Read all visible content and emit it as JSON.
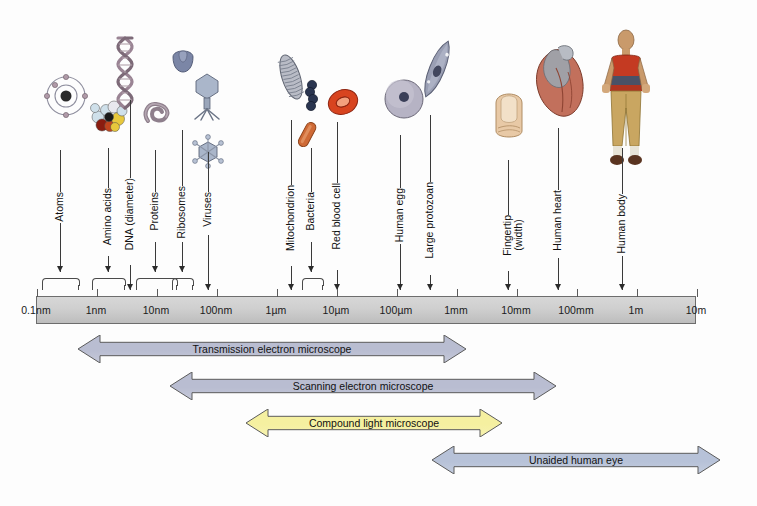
{
  "figure": {
    "colors": {
      "bar_fill": "#cfcfcf",
      "bar_stroke": "#6d6d6d",
      "arrow_grey": "#b9bdd1",
      "arrow_blue": "#b7c2d8",
      "arrow_yellow": "#f5f0a0",
      "arrow_stroke": "#5b5b5b",
      "text": "#111111"
    }
  },
  "scale": {
    "ticks": [
      {
        "label": "0.1nm",
        "x": 36
      },
      {
        "label": "1nm",
        "x": 96
      },
      {
        "label": "10nm",
        "x": 156
      },
      {
        "label": "100nm",
        "x": 216
      },
      {
        "label": "1µm",
        "x": 276
      },
      {
        "label": "10µm",
        "x": 336
      },
      {
        "label": "100µm",
        "x": 396
      },
      {
        "label": "1mm",
        "x": 456
      },
      {
        "label": "10mm",
        "x": 516
      },
      {
        "label": "100mm",
        "x": 576
      },
      {
        "label": "1m",
        "x": 636
      },
      {
        "label": "10m",
        "x": 696
      }
    ]
  },
  "specimens": [
    {
      "name": "Atoms",
      "label": "Atoms",
      "label_x": 60,
      "label_y": 192,
      "leader_x": 60,
      "leader_top": 150,
      "leader_bottom": 272,
      "marker": "brace",
      "brace_left": 42,
      "brace_right": 78
    },
    {
      "name": "Amino acids",
      "label": "Amino acids",
      "label_x": 108,
      "label_y": 188,
      "leader_x": 108,
      "leader_top": 148,
      "leader_bottom": 272,
      "marker": "brace",
      "brace_left": 92,
      "brace_right": 124
    },
    {
      "name": "DNA (diameter)",
      "label": "DNA (diameter)",
      "label_x": 130,
      "label_y": 178,
      "leader_x": 130,
      "leader_top": 100,
      "leader_bottom": 290,
      "marker": "arrow"
    },
    {
      "name": "Proteins",
      "label": "Proteins",
      "label_x": 155,
      "label_y": 192,
      "leader_x": 155,
      "leader_top": 150,
      "leader_bottom": 272,
      "marker": "brace",
      "brace_left": 136,
      "brace_right": 176
    },
    {
      "name": "Ribosomes",
      "label": "Ribosomes",
      "label_x": 182,
      "label_y": 186,
      "leader_x": 182,
      "leader_top": 130,
      "leader_bottom": 272,
      "marker": "brace",
      "brace_left": 172,
      "brace_right": 192
    },
    {
      "name": "Viruses",
      "label": "Viruses",
      "label_x": 208,
      "label_y": 192,
      "leader_x": 208,
      "leader_top": 152,
      "leader_bottom": 290,
      "marker": "arrow"
    },
    {
      "name": "Mitochondrion",
      "label": "Mitochondrion",
      "label_x": 291,
      "label_y": 185,
      "leader_x": 291,
      "leader_top": 120,
      "leader_bottom": 290,
      "marker": "arrow"
    },
    {
      "name": "Bacteria",
      "label": "Bacteria",
      "label_x": 311,
      "label_y": 192,
      "leader_x": 311,
      "leader_top": 148,
      "leader_bottom": 272,
      "marker": "brace",
      "brace_left": 302,
      "brace_right": 322
    },
    {
      "name": "Red blood cell",
      "label": "Red blood cell",
      "label_x": 337,
      "label_y": 183,
      "leader_x": 337,
      "leader_top": 122,
      "leader_bottom": 290,
      "marker": "arrow"
    },
    {
      "name": "Human egg",
      "label": "Human egg",
      "label_x": 400,
      "label_y": 188,
      "leader_x": 400,
      "leader_top": 135,
      "leader_bottom": 290,
      "marker": "arrow"
    },
    {
      "name": "Large protozoan",
      "label": "Large protozoan",
      "label_x": 430,
      "label_y": 182,
      "leader_x": 430,
      "leader_top": 115,
      "leader_bottom": 290,
      "marker": "arrow"
    },
    {
      "name": "Fingertip",
      "label": "Fingertip\n(width)",
      "label_x": 508,
      "label_y": 215,
      "leader_x": 508,
      "leader_top": 160,
      "leader_bottom": 290,
      "marker": "arrow"
    },
    {
      "name": "Human heart",
      "label": "Human heart",
      "label_x": 558,
      "label_y": 190,
      "leader_x": 558,
      "leader_top": 128,
      "leader_bottom": 290,
      "marker": "arrow"
    },
    {
      "name": "Human body",
      "label": "Human body",
      "label_x": 622,
      "label_y": 194,
      "leader_x": 622,
      "leader_top": 148,
      "leader_bottom": 290,
      "marker": "arrow"
    }
  ],
  "ranges": [
    {
      "label": "Transmission electron microscope",
      "left": 78,
      "right": 466,
      "top": 335,
      "height": 28,
      "color": "#b9bdd1"
    },
    {
      "label": "Scanning electron microscope",
      "left": 170,
      "right": 556,
      "top": 372,
      "height": 28,
      "color": "#b9bdd1"
    },
    {
      "label": "Compound light microscope",
      "left": 246,
      "right": 502,
      "top": 409,
      "height": 28,
      "color": "#f5f0a0"
    },
    {
      "label": "Unaided human eye",
      "left": 432,
      "right": 720,
      "top": 446,
      "height": 28,
      "color": "#b7c2d8"
    }
  ],
  "illustrations": [
    {
      "name": "atom-illustration",
      "x": 45,
      "y": 75,
      "kind": "atom"
    },
    {
      "name": "amino-acid-illustration",
      "x": 88,
      "y": 95,
      "kind": "molecule"
    },
    {
      "name": "dna-helix-illustration",
      "x": 112,
      "y": 36,
      "kind": "dna"
    },
    {
      "name": "protein-illustration",
      "x": 140,
      "y": 95,
      "kind": "protein"
    },
    {
      "name": "ribosome-illustration",
      "x": 168,
      "y": 45,
      "kind": "ribosome"
    },
    {
      "name": "bacteriophage-illustration",
      "x": 190,
      "y": 72,
      "kind": "phage"
    },
    {
      "name": "virus-illustration",
      "x": 192,
      "y": 135,
      "kind": "virus"
    },
    {
      "name": "mitochondrion-illustration",
      "x": 278,
      "y": 52,
      "kind": "mitochondrion"
    },
    {
      "name": "bacteria-cocci-illustration",
      "x": 303,
      "y": 80,
      "kind": "cocci"
    },
    {
      "name": "bacteria-rod-illustration",
      "x": 296,
      "y": 120,
      "kind": "rod"
    },
    {
      "name": "red-blood-cell-illustration",
      "x": 325,
      "y": 85,
      "kind": "rbc"
    },
    {
      "name": "human-egg-illustration",
      "x": 383,
      "y": 78,
      "kind": "egg"
    },
    {
      "name": "protozoan-illustration",
      "x": 420,
      "y": 38,
      "kind": "protozoan"
    },
    {
      "name": "fingertip-illustration",
      "x": 492,
      "y": 85,
      "kind": "fingertip"
    },
    {
      "name": "heart-illustration",
      "x": 528,
      "y": 42,
      "kind": "heart"
    },
    {
      "name": "human-body-illustration",
      "x": 596,
      "y": 28,
      "kind": "body"
    }
  ]
}
